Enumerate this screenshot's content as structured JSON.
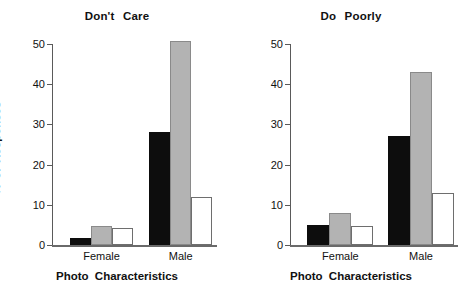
{
  "chart_data": [
    {
      "type": "bar",
      "title": "Don't  Care",
      "xlabel": "Photo  Characteristics",
      "ylabel": "%  of  Responses",
      "categories": [
        "Female",
        "Male"
      ],
      "ylim": [
        0,
        50
      ],
      "yticks": [
        0,
        10,
        20,
        30,
        40,
        50
      ],
      "grid": false,
      "legend": "none",
      "series": [
        {
          "name": "series-1",
          "color": "#0d0d0d",
          "values": [
            1.7,
            28
          ]
        },
        {
          "name": "series-2",
          "color": "#b3b3b3",
          "values": [
            4.7,
            50.7
          ]
        },
        {
          "name": "series-3",
          "color": "#ffffff",
          "values": [
            4.2,
            12
          ]
        }
      ]
    },
    {
      "type": "bar",
      "title": "Do  Poorly",
      "xlabel": "Photo  Characteristics",
      "ylabel": "",
      "categories": [
        "Female",
        "Male"
      ],
      "ylim": [
        0,
        50
      ],
      "yticks": [
        0,
        10,
        20,
        30,
        40,
        50
      ],
      "grid": false,
      "legend": "none",
      "series": [
        {
          "name": "series-1",
          "color": "#0d0d0d",
          "values": [
            5,
            27
          ]
        },
        {
          "name": "series-2",
          "color": "#b3b3b3",
          "values": [
            8,
            43
          ]
        },
        {
          "name": "series-3",
          "color": "#ffffff",
          "values": [
            4.7,
            13
          ]
        }
      ]
    }
  ],
  "left": {
    "title": "Don't  Care",
    "ylabel": "%  of  Responses",
    "xlabel": "Photo  Characteristics",
    "yticks": [
      "0",
      "10",
      "20",
      "30",
      "40",
      "50"
    ],
    "cat0": "Female",
    "cat1": "Male"
  },
  "right": {
    "title": "Do  Poorly",
    "xlabel": "Photo  Characteristics",
    "yticks": [
      "0",
      "10",
      "20",
      "30",
      "40",
      "50"
    ],
    "cat0": "Female",
    "cat1": "Male"
  }
}
